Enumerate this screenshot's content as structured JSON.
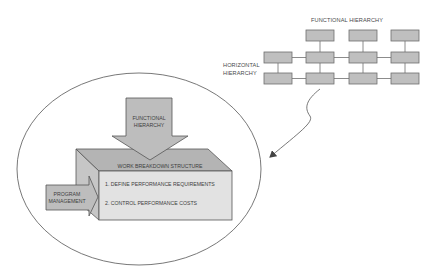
{
  "matrix": {
    "functional_label": "FUNCTIONAL HIERARCHY",
    "horizontal_label_line1": "HORIZONTAL",
    "horizontal_label_line2": "HIERARCHY"
  },
  "down_arrow": {
    "line1": "FUNCTIONAL",
    "line2": "HIERARCHY"
  },
  "side_arrow": {
    "line1": "PROGRAM",
    "line2": "MANAGEMENT"
  },
  "wbs_box": {
    "title": "WORK BREAKDOWN STRUCTURE",
    "items": [
      "1. DEFINE PERFORMANCE REQUIREMENTS",
      "2. CONTROL PERFORMANCE COSTS"
    ]
  },
  "colors": {
    "box_fill": "#bfbfbf",
    "top_face": "#b4b4b4",
    "left_face": "#c6c6c6",
    "front_face": "#e2e2e2",
    "outline": "#6e6e6e"
  }
}
